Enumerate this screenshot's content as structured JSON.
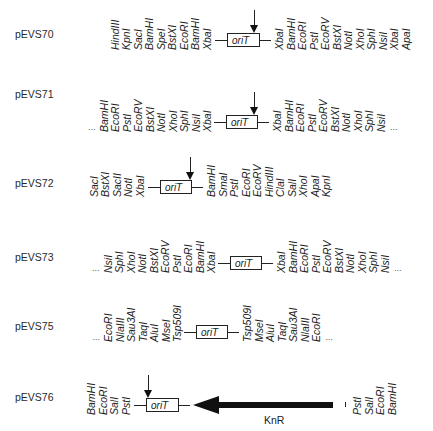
{
  "figure": {
    "element_label": "oriT",
    "resistance_label": "KnR",
    "ellipsis": "...",
    "rows": [
      {
        "name": "pEVS70",
        "left_sites": [
          "HindIII",
          "KpnI",
          "SacI",
          "BamHI",
          "SpeI",
          "BstXI",
          "EcoRI",
          "BamHI",
          "XbaI"
        ],
        "right_sites": [
          "XbaI",
          "BamHI",
          "EcoRI",
          "PstI",
          "EcoRV",
          "BstXI",
          "NotI",
          "XhoI",
          "SphI",
          "NsiI",
          "XbaI",
          "ApaI"
        ],
        "left_ellipsis": false,
        "right_ellipsis": false,
        "arrow": true
      },
      {
        "name": "pEVS71",
        "left_sites": [
          "BamHI",
          "EcoRI",
          "PstI",
          "EcoRV",
          "BstXI",
          "NotI",
          "XhoI",
          "SphI",
          "NsiI",
          "XbaI"
        ],
        "right_sites": [
          "XbaI",
          "BamHI",
          "EcoRI",
          "PstI",
          "EcoRV",
          "BstXI",
          "NotI",
          "XhoI",
          "SphI",
          "NsiI"
        ],
        "left_ellipsis": true,
        "right_ellipsis": true,
        "arrow": true
      },
      {
        "name": "pEVS72",
        "left_sites": [
          "SacI",
          "BstXI",
          "SacII",
          "NotI",
          "XbaI"
        ],
        "right_sites": [
          "BamHI",
          "SmaI",
          "PstI",
          "EcoRI",
          "EcoRV",
          "HindIII",
          "ClaI",
          "SalI",
          "XhoI",
          "ApaI",
          "KpnI"
        ],
        "left_ellipsis": false,
        "right_ellipsis": false,
        "arrow": true
      },
      {
        "name": "pEVS73",
        "left_sites": [
          "NsiI",
          "SphI",
          "XhoI",
          "NotI",
          "BstXI",
          "EcoRV",
          "PstI",
          "EcoRI",
          "BamHI",
          "XbaI"
        ],
        "right_sites": [
          "XbaI",
          "BamHI",
          "EcoRI",
          "PstI",
          "EcoRV",
          "BstXI",
          "NotI",
          "XhoI",
          "SphI",
          "NsiI"
        ],
        "left_ellipsis": true,
        "right_ellipsis": true,
        "arrow": false
      },
      {
        "name": "pEVS75",
        "left_sites": [
          "EcoRI",
          "NlaIII",
          "Sau3AI",
          "TaqI",
          "AluI",
          "MseI",
          "Tsp509I"
        ],
        "right_sites": [
          "Tsp509I",
          "MseI",
          "AluI",
          "TaqI",
          "Sau3AI",
          "NlaIII",
          "EcoRI"
        ],
        "left_ellipsis": true,
        "right_ellipsis": true,
        "arrow": false
      },
      {
        "name": "pEVS76",
        "left_sites": [
          "BamHI",
          "EcoRI",
          "SalI",
          "PstI"
        ],
        "right_sites": [
          "PstI",
          "SalI",
          "EcoRI",
          "BamHI"
        ],
        "left_ellipsis": false,
        "right_ellipsis": false,
        "arrow": true,
        "has_knr": true
      }
    ]
  },
  "colors": {
    "ink": "#1a1a1a",
    "background": "#ffffff"
  }
}
